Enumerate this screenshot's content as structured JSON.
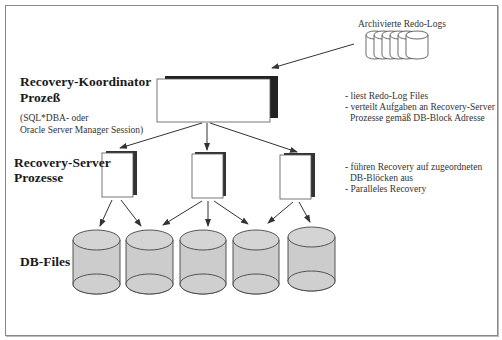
{
  "diagram": {
    "archive": {
      "label": "Archivierte Redo-Logs",
      "cylinder_count": 6
    },
    "coordinator": {
      "title_line1": "Recovery-Koordinator",
      "title_line2": "Prozeß",
      "note_line1": "(SQL*DBA- oder",
      "note_line2": "Oracle Server Manager Session)",
      "desc_line1": "- liest Redo-Log Files",
      "desc_line2": "- verteilt Aufgaben an Recovery-Server",
      "desc_line3": "  Prozesse gemäß DB-Block Adresse"
    },
    "servers": {
      "title_line1": "Recovery-Server",
      "title_line2": "Prozesse",
      "count": 3,
      "desc_line1": "- führen Recovery auf zugeordneten",
      "desc_line2": "  DB-Blöcken aus",
      "desc_line3": "- Paralleles Recovery"
    },
    "db_files": {
      "label": "DB-Files",
      "count": 5
    },
    "colors": {
      "frame": "#888888",
      "shadow": "#222222",
      "cylinder_fill": "#cccccc",
      "cylinder_top": "#d4d4d4",
      "line": "#333333"
    }
  }
}
